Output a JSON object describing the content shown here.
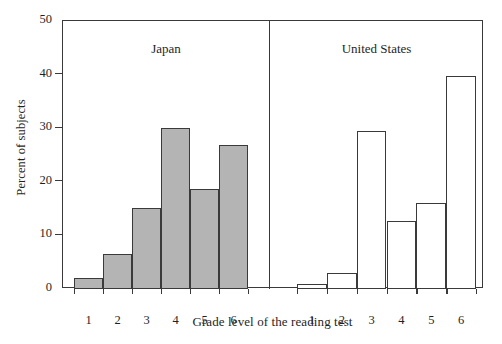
{
  "chart_data": {
    "type": "bar",
    "title": "",
    "xlabel": "Grade level of the reading test",
    "ylabel": "Percent of subjects",
    "categories": [
      "1",
      "2",
      "3",
      "4",
      "5",
      "6"
    ],
    "ylim": [
      0,
      50
    ],
    "yticks": [
      0,
      10,
      20,
      30,
      40,
      50
    ],
    "ytick_labels": [
      "0",
      "10",
      "20",
      "30",
      "40",
      "50"
    ],
    "grid": false,
    "legend_position": "none",
    "panels": [
      {
        "name": "Japan",
        "fill": "#b4b4b4",
        "edge": "#3a3a3a",
        "values": [
          2.0,
          6.5,
          15.2,
          30.0,
          18.6,
          26.8
        ]
      },
      {
        "name": "United States",
        "fill": "#ffffff",
        "edge": "#3a3a3a",
        "values": [
          1.0,
          3.0,
          29.5,
          12.6,
          16.0,
          39.8
        ]
      }
    ],
    "series": [
      {
        "name": "Japan",
        "values": [
          2.0,
          6.5,
          15.2,
          30.0,
          18.6,
          26.8
        ]
      },
      {
        "name": "United States",
        "values": [
          1.0,
          3.0,
          29.5,
          12.6,
          16.0,
          39.8
        ]
      }
    ],
    "colors": {
      "japan_fill": "#b4b4b4",
      "us_fill": "#ffffff",
      "edge": "#3a3a3a",
      "text": "#1f1f1f",
      "background": "#ffffff"
    }
  },
  "axes": {
    "y_title": "Percent of subjects",
    "x_title": "Grade level of the reading test",
    "y_labels": [
      "50",
      "40",
      "30",
      "20",
      "10",
      "0"
    ],
    "x_labels": [
      "1",
      "2",
      "3",
      "4",
      "5",
      "6"
    ]
  },
  "panels": {
    "left_title": "Japan",
    "right_title": "United States"
  }
}
